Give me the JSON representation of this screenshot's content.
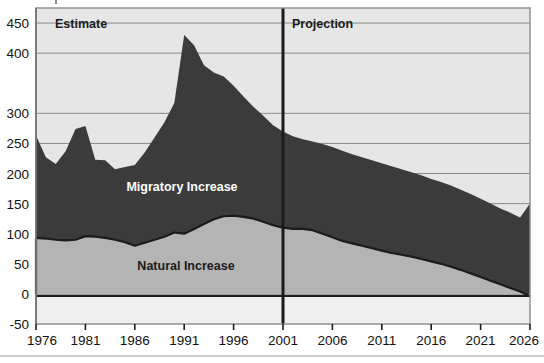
{
  "chart_data": {
    "type": "area",
    "stacked": true,
    "title": "",
    "subtitle": "",
    "xlabel": "",
    "ylabel": "",
    "xlim": [
      1976,
      2026
    ],
    "ylim": [
      -50,
      475
    ],
    "y_ticks": [
      -50,
      0,
      50,
      100,
      150,
      200,
      250,
      300,
      400,
      450
    ],
    "y_tick_labels": [
      "-50",
      "0",
      "50",
      "100",
      "150",
      "200",
      "250",
      "300",
      "400",
      "450"
    ],
    "x_ticks": [
      1976,
      1981,
      1986,
      1991,
      1996,
      2001,
      2006,
      2011,
      2016,
      2021,
      2026
    ],
    "x_tick_labels": [
      "1976",
      "1981",
      "1986",
      "1991",
      "1996",
      "2001",
      "2006",
      "2011",
      "2016",
      "2021",
      "2026"
    ],
    "grid": true,
    "grid_axis": "y",
    "legend_position": "inline-annotations",
    "x": [
      1976,
      1977,
      1978,
      1979,
      1980,
      1981,
      1982,
      1983,
      1984,
      1985,
      1986,
      1987,
      1988,
      1989,
      1990,
      1991,
      1992,
      1993,
      1994,
      1995,
      1996,
      1997,
      1998,
      1999,
      2000,
      2001,
      2002,
      2003,
      2004,
      2005,
      2006,
      2007,
      2008,
      2009,
      2010,
      2011,
      2012,
      2013,
      2014,
      2015,
      2016,
      2017,
      2018,
      2019,
      2020,
      2021,
      2022,
      2023,
      2024,
      2025,
      2026
    ],
    "series": [
      {
        "name": "Natural Increase",
        "color": "#b4b4b4",
        "values": [
          93,
          92,
          90,
          89,
          90,
          96,
          95,
          93,
          90,
          86,
          80,
          85,
          90,
          95,
          102,
          100,
          108,
          116,
          124,
          129,
          130,
          128,
          125,
          120,
          114,
          110,
          108,
          108,
          106,
          100,
          94,
          88,
          84,
          80,
          76,
          72,
          68,
          65,
          62,
          58,
          54,
          50,
          45,
          40,
          34,
          28,
          22,
          16,
          10,
          4,
          -4
        ]
      },
      {
        "name": "Migratory Increase",
        "color": "#3b3b3b",
        "values": [
          170,
          135,
          126,
          148,
          184,
          183,
          128,
          129,
          117,
          125,
          134,
          150,
          170,
          190,
          215,
          330,
          305,
          264,
          244,
          232,
          216,
          200,
          186,
          176,
          166,
          160,
          154,
          149,
          147,
          149,
          150,
          150,
          148,
          147,
          146,
          145,
          144,
          142,
          140,
          139,
          137,
          136,
          135,
          133,
          132,
          130,
          128,
          126,
          125,
          123,
          154
        ]
      }
    ],
    "totals": [
      263,
      227,
      216,
      237,
      274,
      279,
      223,
      222,
      207,
      211,
      214,
      235,
      260,
      285,
      317,
      430,
      413,
      380,
      368,
      361,
      346,
      328,
      311,
      296,
      280,
      270,
      262,
      257,
      253,
      249,
      244,
      238,
      232,
      227,
      222,
      217,
      212,
      207,
      202,
      197,
      191,
      186,
      180,
      173,
      166,
      158,
      150,
      142,
      135,
      127,
      150
    ]
  },
  "annotations": {
    "estimate_label": "Estimate",
    "projection_label": "Projection",
    "natural_increase_label": "Natural Increase",
    "migratory_increase_label": "Migratory Increase",
    "divider_year": "2001"
  },
  "colors": {
    "migratory_fill": "#3b3b3b",
    "natural_fill": "#b4b4b4",
    "plot_background": "#e6e6e6",
    "below_zero_background": "#efefef",
    "gridline": "#8a8a8a",
    "axis_line": "#1b1b1b",
    "divider_line": "#1b1b1b",
    "page_background": "#ffffff",
    "label_dark": "#1b1b1b",
    "label_light": "#ffffff"
  }
}
